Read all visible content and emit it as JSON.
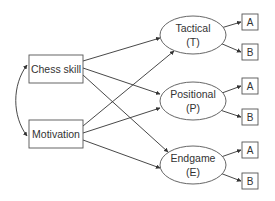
{
  "diagram": {
    "type": "path-model",
    "colors": {
      "line": "#333333",
      "node_border": "#555555",
      "text": "#333333",
      "background": "#ffffff"
    },
    "predictors": [
      {
        "id": "chess_skill",
        "label": "Chess skill"
      },
      {
        "id": "motivation",
        "label": "Motivation"
      }
    ],
    "latents": [
      {
        "id": "tactical",
        "label": "Tactical",
        "abbr": "(T)",
        "indicators": [
          "A",
          "B"
        ]
      },
      {
        "id": "positional",
        "label": "Positional",
        "abbr": "(P)",
        "indicators": [
          "A",
          "B"
        ]
      },
      {
        "id": "endgame",
        "label": "Endgame",
        "abbr": "(E)",
        "indicators": [
          "A",
          "B"
        ]
      }
    ],
    "covariance": {
      "from": "chess_skill",
      "to": "motivation",
      "type": "double-headed-curved"
    },
    "paths": [
      {
        "from": "chess_skill",
        "to": "tactical"
      },
      {
        "from": "chess_skill",
        "to": "positional"
      },
      {
        "from": "chess_skill",
        "to": "endgame"
      },
      {
        "from": "motivation",
        "to": "tactical"
      },
      {
        "from": "motivation",
        "to": "positional"
      },
      {
        "from": "motivation",
        "to": "endgame"
      }
    ]
  }
}
